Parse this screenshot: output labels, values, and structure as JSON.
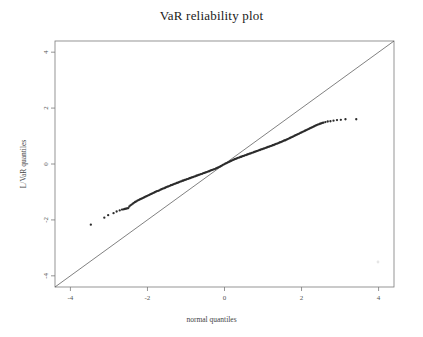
{
  "chart_data": {
    "type": "scatter",
    "title": "VaR reliability plot",
    "xlabel": "normal quantiles",
    "ylabel": "L/VaR quantiles",
    "xlim": [
      -4.4,
      4.4
    ],
    "ylim": [
      -4.4,
      4.4
    ],
    "grid": false,
    "legend": null,
    "xticks": [
      -4,
      -2,
      0,
      2,
      4
    ],
    "xtick_labels": [
      "-4",
      "-2",
      "0",
      "2",
      "4"
    ],
    "yticks": [
      -4,
      -2,
      0,
      2,
      4
    ],
    "ytick_labels": [
      "-4",
      "-2",
      "0",
      "2",
      "4"
    ],
    "reference_line": {
      "name": "y = x identity line",
      "slope": 1,
      "intercept": 0,
      "x_from": -4.4,
      "x_to": 4.4
    },
    "series": [
      {
        "name": "sample quantiles",
        "marker": "point",
        "x": [
          -3.47,
          -3.12,
          -3.02,
          -2.88,
          -2.8,
          -2.72,
          -2.66,
          -2.62,
          -2.59,
          -2.56,
          -2.53,
          -2.5,
          -2.47,
          -2.44,
          -2.41,
          -2.38,
          -2.35,
          -2.32,
          -2.29,
          -2.26,
          -2.23,
          -2.2,
          -2.17,
          -2.14,
          -2.11,
          -2.08,
          -2.05,
          -2.02,
          -1.99,
          -1.96,
          -1.93,
          -1.9,
          -1.87,
          -1.84,
          -1.81,
          -1.78,
          -1.75,
          -1.72,
          -1.69,
          -1.66,
          -1.63,
          -1.6,
          -1.57,
          -1.54,
          -1.51,
          -1.48,
          -1.45,
          -1.42,
          -1.39,
          -1.36,
          -1.33,
          -1.3,
          -1.27,
          -1.24,
          -1.21,
          -1.18,
          -1.15,
          -1.12,
          -1.09,
          -1.06,
          -1.03,
          -1.0,
          -0.97,
          -0.94,
          -0.91,
          -0.88,
          -0.85,
          -0.82,
          -0.79,
          -0.76,
          -0.73,
          -0.7,
          -0.67,
          -0.64,
          -0.61,
          -0.58,
          -0.55,
          -0.52,
          -0.49,
          -0.46,
          -0.43,
          -0.4,
          -0.37,
          -0.34,
          -0.31,
          -0.28,
          -0.25,
          -0.22,
          -0.19,
          -0.16,
          -0.13,
          -0.1,
          -0.07,
          -0.04,
          -0.01,
          0.02,
          0.05,
          0.08,
          0.11,
          0.14,
          0.17,
          0.2,
          0.23,
          0.26,
          0.29,
          0.32,
          0.35,
          0.38,
          0.41,
          0.44,
          0.47,
          0.5,
          0.53,
          0.56,
          0.59,
          0.62,
          0.65,
          0.68,
          0.71,
          0.74,
          0.77,
          0.8,
          0.83,
          0.86,
          0.89,
          0.92,
          0.95,
          0.98,
          1.01,
          1.04,
          1.07,
          1.1,
          1.13,
          1.16,
          1.19,
          1.22,
          1.25,
          1.28,
          1.31,
          1.34,
          1.37,
          1.4,
          1.43,
          1.46,
          1.49,
          1.52,
          1.55,
          1.58,
          1.61,
          1.64,
          1.67,
          1.7,
          1.73,
          1.76,
          1.79,
          1.82,
          1.85,
          1.88,
          1.91,
          1.94,
          1.97,
          2.0,
          2.03,
          2.06,
          2.09,
          2.12,
          2.15,
          2.18,
          2.21,
          2.24,
          2.27,
          2.3,
          2.33,
          2.36,
          2.39,
          2.42,
          2.45,
          2.48,
          2.51,
          2.54,
          2.57,
          2.62,
          2.68,
          2.75,
          2.83,
          2.92,
          3.02,
          3.14,
          3.42
        ],
        "y": [
          -2.17,
          -1.92,
          -1.83,
          -1.76,
          -1.7,
          -1.66,
          -1.63,
          -1.62,
          -1.61,
          -1.6,
          -1.59,
          -1.58,
          -1.52,
          -1.48,
          -1.45,
          -1.42,
          -1.39,
          -1.36,
          -1.34,
          -1.31,
          -1.29,
          -1.27,
          -1.25,
          -1.23,
          -1.21,
          -1.19,
          -1.17,
          -1.15,
          -1.13,
          -1.11,
          -1.09,
          -1.07,
          -1.05,
          -1.03,
          -1.01,
          -0.99,
          -0.97,
          -0.96,
          -0.94,
          -0.92,
          -0.9,
          -0.88,
          -0.87,
          -0.85,
          -0.83,
          -0.81,
          -0.8,
          -0.78,
          -0.76,
          -0.75,
          -0.73,
          -0.71,
          -0.7,
          -0.68,
          -0.67,
          -0.65,
          -0.63,
          -0.62,
          -0.6,
          -0.59,
          -0.57,
          -0.56,
          -0.54,
          -0.53,
          -0.51,
          -0.5,
          -0.48,
          -0.47,
          -0.45,
          -0.44,
          -0.42,
          -0.41,
          -0.39,
          -0.38,
          -0.36,
          -0.35,
          -0.33,
          -0.32,
          -0.3,
          -0.29,
          -0.27,
          -0.26,
          -0.24,
          -0.22,
          -0.21,
          -0.19,
          -0.18,
          -0.16,
          -0.14,
          -0.12,
          -0.1,
          -0.08,
          -0.06,
          -0.03,
          -0.01,
          0.01,
          0.03,
          0.05,
          0.07,
          0.09,
          0.11,
          0.13,
          0.15,
          0.17,
          0.18,
          0.2,
          0.22,
          0.23,
          0.25,
          0.26,
          0.28,
          0.29,
          0.31,
          0.32,
          0.34,
          0.35,
          0.37,
          0.38,
          0.4,
          0.41,
          0.43,
          0.44,
          0.46,
          0.47,
          0.49,
          0.5,
          0.52,
          0.53,
          0.55,
          0.56,
          0.58,
          0.59,
          0.61,
          0.62,
          0.64,
          0.65,
          0.67,
          0.68,
          0.7,
          0.72,
          0.73,
          0.75,
          0.77,
          0.78,
          0.8,
          0.82,
          0.84,
          0.85,
          0.87,
          0.89,
          0.91,
          0.93,
          0.95,
          0.97,
          0.99,
          1.01,
          1.03,
          1.05,
          1.07,
          1.09,
          1.11,
          1.13,
          1.15,
          1.17,
          1.19,
          1.21,
          1.23,
          1.25,
          1.27,
          1.29,
          1.31,
          1.33,
          1.35,
          1.37,
          1.39,
          1.41,
          1.42,
          1.44,
          1.45,
          1.47,
          1.48,
          1.5,
          1.52,
          1.53,
          1.55,
          1.57,
          1.58,
          1.6,
          1.6
        ]
      }
    ]
  }
}
